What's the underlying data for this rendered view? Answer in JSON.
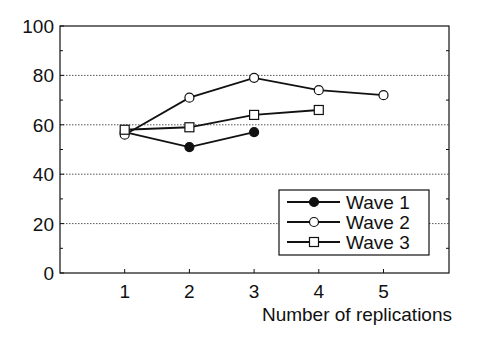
{
  "chart_data": {
    "type": "line",
    "title": "",
    "xlabel": "Number of replications",
    "ylabel": "",
    "x": [
      1,
      2,
      3,
      4,
      5
    ],
    "xticks": [
      "1",
      "2",
      "3",
      "4",
      "5"
    ],
    "yticks": [
      "0",
      "20",
      "40",
      "60",
      "80",
      "100"
    ],
    "ylim": [
      0,
      100
    ],
    "xlim": [
      0,
      6
    ],
    "grid": "horizontal dotted at 20, 40, 60, 80",
    "legend_position": "lower right",
    "series": [
      {
        "name": "Wave 1",
        "marker": "filled-circle",
        "x": [
          1,
          2,
          3
        ],
        "values": [
          57,
          51,
          57
        ]
      },
      {
        "name": "Wave 2",
        "marker": "open-circle",
        "x": [
          1,
          2,
          3,
          4,
          5
        ],
        "values": [
          56,
          71,
          79,
          74,
          72
        ]
      },
      {
        "name": "Wave 3",
        "marker": "open-square",
        "x": [
          1,
          2,
          3,
          4
        ],
        "values": [
          58,
          59,
          64,
          66
        ]
      }
    ]
  }
}
